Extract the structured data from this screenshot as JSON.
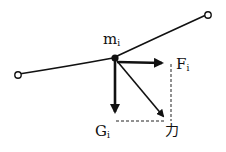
{
  "diagram": {
    "labels": {
      "mass": {
        "main": "m",
        "sub": "i"
      },
      "force_horizontal": {
        "main": "F",
        "sub": "i"
      },
      "gravity": {
        "main": "G",
        "sub": "i"
      },
      "resultant": "力"
    },
    "colors": {
      "ink": "#111111",
      "background": "#ffffff"
    }
  }
}
